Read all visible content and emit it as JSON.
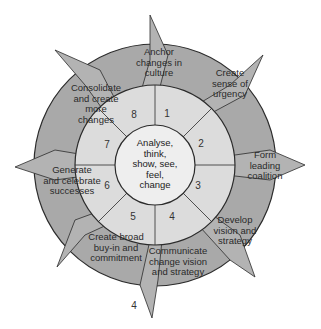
{
  "diagram": {
    "center": {
      "label": "Analyse,\nthink,\nshow, see,\nfeel,\nchange"
    },
    "steps": [
      {
        "number": "1",
        "label": "Create\nsense of\nurgency"
      },
      {
        "number": "2",
        "label": "Form\nleading\ncoalition"
      },
      {
        "number": "3",
        "label": "Develop\nvision and\nstrategy"
      },
      {
        "number": "4",
        "label": "Communicate\nchange vision\nand strategy"
      },
      {
        "number": "5",
        "label": "Create broad\nbuy-in and\ncommitment"
      },
      {
        "number": "6",
        "label": "Generate\nand celebrate\nsuccesses"
      },
      {
        "number": "7",
        "label": "Consolidate\nand create\nmore\nchanges"
      },
      {
        "number": "8",
        "label": "Anchor\nchanges in\nculture"
      }
    ],
    "stray_label": "4",
    "colors": {
      "outer_ring": "#a9a9a9",
      "middle_ring": "#dcdcdc",
      "center": "#eeeeee",
      "arrow": "#b3b3b3",
      "stroke": "#2b2b2b"
    }
  }
}
